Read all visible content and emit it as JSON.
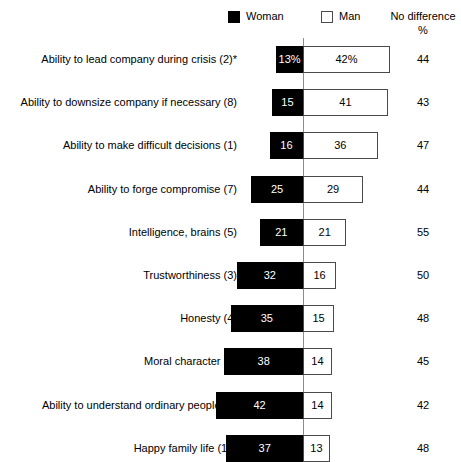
{
  "legend": {
    "woman_label": "Woman",
    "man_label": "Man",
    "woman_swatch": "filled-square-icon",
    "man_swatch": "outlined-square-icon"
  },
  "columns": {
    "no_difference_header": "No difference",
    "no_difference_unit": "%"
  },
  "chart_data": {
    "type": "bar",
    "title": "",
    "subtitle": "",
    "xlabel": "",
    "ylabel": "",
    "orientation": "horizontal",
    "style": "diverging-bidirectional",
    "grid": false,
    "legend_position": "top",
    "axis_center": 0,
    "xlim": [
      -45,
      45
    ],
    "units": "percent",
    "categories": [
      "Ability to lead company during crisis (2)*",
      "Ability to downsize company if necessary (8)",
      "Ability to make difficult decisions (1)",
      "Ability to forge compromise (7)",
      "Intelligence, brains (5)",
      "Trustworthiness (3)",
      "Honesty (4)",
      "Moral character (9)",
      "Ability to understand ordinary people (6)",
      "Happy family life (10)"
    ],
    "series": [
      {
        "name": "Woman",
        "direction": "left",
        "values": [
          13,
          15,
          16,
          25,
          21,
          32,
          35,
          38,
          42,
          37
        ],
        "labels": [
          "13%",
          "15",
          "16",
          "25",
          "21",
          "32",
          "35",
          "38",
          "42",
          "37"
        ]
      },
      {
        "name": "Man",
        "direction": "right",
        "values": [
          42,
          41,
          36,
          29,
          21,
          16,
          15,
          14,
          14,
          13
        ],
        "labels": [
          "42%",
          "41",
          "36",
          "29",
          "21",
          "16",
          "15",
          "14",
          "14",
          "13"
        ]
      },
      {
        "name": "No difference",
        "direction": "column",
        "values": [
          44,
          43,
          47,
          44,
          55,
          50,
          48,
          45,
          42,
          48
        ],
        "labels": [
          "44",
          "43",
          "47",
          "44",
          "55",
          "50",
          "48",
          "45",
          "42",
          "48"
        ]
      }
    ]
  },
  "colors": {
    "woman_bar": "#000000",
    "man_bar": "#ffffff",
    "man_bar_border": "#4a4a4a",
    "axis": "#8d8d8d",
    "text": "#000000"
  }
}
